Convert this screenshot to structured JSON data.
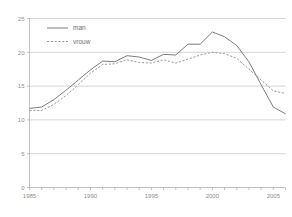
{
  "chart_data": {
    "type": "line",
    "title": "",
    "subtitle": "",
    "xlabel": "",
    "ylabel": "",
    "xlim": [
      1985,
      2006
    ],
    "ylim": [
      0,
      25
    ],
    "grid": true,
    "legend_position": "top-left",
    "x": [
      1985,
      1986,
      1987,
      1988,
      1989,
      1990,
      1991,
      1992,
      1993,
      1994,
      1995,
      1996,
      1997,
      1998,
      1999,
      2000,
      2001,
      2002,
      2003,
      2004,
      2005,
      2006
    ],
    "xtick_labels": [
      "1985",
      "1990",
      "1995",
      "2000",
      "2005"
    ],
    "xtick_values": [
      1985,
      1990,
      1995,
      2000,
      2005
    ],
    "ytick_labels": [
      "0",
      "5",
      "10",
      "15",
      "20",
      "25"
    ],
    "ytick_values": [
      0,
      5,
      10,
      15,
      20,
      25
    ],
    "series": [
      {
        "name": "man",
        "style": "solid",
        "color": "#6d6d6d",
        "values": [
          11.7,
          11.9,
          13.0,
          14.4,
          15.9,
          17.4,
          18.7,
          18.6,
          19.5,
          19.3,
          18.8,
          19.7,
          19.6,
          21.2,
          21.2,
          23.0,
          22.3,
          21.0,
          18.6,
          15.2,
          11.9,
          10.9
        ]
      },
      {
        "name": "vrouw",
        "style": "dashed",
        "color": "#8e8e8e",
        "values": [
          11.4,
          11.4,
          12.3,
          13.6,
          15.2,
          16.9,
          18.2,
          18.3,
          18.9,
          18.5,
          18.4,
          18.9,
          18.4,
          19.0,
          19.6,
          20.0,
          19.8,
          19.1,
          17.5,
          15.9,
          14.3,
          13.9
        ]
      }
    ]
  },
  "legend": {
    "items": [
      {
        "label": "man"
      },
      {
        "label": "vrouw"
      }
    ]
  },
  "colors": {
    "man": "#6d6d6d",
    "vrouw": "#8e8e8e",
    "grid": "#b9b9b9",
    "axis": "#9a9a9a",
    "text": "#8d8d8d",
    "background": "#ffffff"
  }
}
